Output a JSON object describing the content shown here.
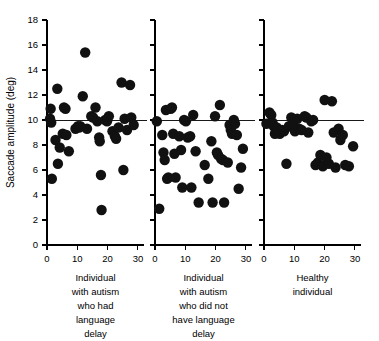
{
  "chart_data": {
    "type": "scatter",
    "title": "",
    "xlabel": "",
    "ylabel": "Saccade amplitude (deg)",
    "ylim": [
      0,
      18
    ],
    "xlim": [
      0,
      32
    ],
    "yticks": [
      0,
      2,
      4,
      6,
      8,
      10,
      12,
      14,
      16,
      18
    ],
    "ytick_labels": [
      "0",
      "2",
      "4",
      "6",
      "8",
      "10",
      "12",
      "14",
      "16",
      "18"
    ],
    "xticks": [
      0,
      10,
      20,
      30
    ],
    "xtick_labels": [
      "0",
      "10",
      "20",
      "30"
    ],
    "grid": false,
    "legend": "none",
    "reference_line": {
      "y": 10,
      "label": ""
    },
    "marker": {
      "shape": "circle",
      "color": "#111111",
      "size": 5.2
    },
    "panels": [
      {
        "id": "panel-autism-language-delay",
        "caption_lines": [
          "Individual",
          "with autism",
          "who had",
          "language",
          "delay"
        ],
        "caption": "Individual with autism who had language delay",
        "points": [
          {
            "x": 1.0,
            "y": 10.1
          },
          {
            "x": 1.2,
            "y": 10.9
          },
          {
            "x": 1.4,
            "y": 9.8
          },
          {
            "x": 1.6,
            "y": 5.3
          },
          {
            "x": 2.8,
            "y": 8.4
          },
          {
            "x": 3.4,
            "y": 12.5
          },
          {
            "x": 3.6,
            "y": 6.5
          },
          {
            "x": 4.2,
            "y": 7.8
          },
          {
            "x": 5.2,
            "y": 8.9
          },
          {
            "x": 5.6,
            "y": 11.0
          },
          {
            "x": 6.1,
            "y": 10.9
          },
          {
            "x": 6.4,
            "y": 8.8
          },
          {
            "x": 7.2,
            "y": 7.5
          },
          {
            "x": 9.4,
            "y": 9.3
          },
          {
            "x": 10.2,
            "y": 9.5
          },
          {
            "x": 10.6,
            "y": 9.4
          },
          {
            "x": 11.0,
            "y": 9.5
          },
          {
            "x": 11.8,
            "y": 11.9
          },
          {
            "x": 12.6,
            "y": 15.4
          },
          {
            "x": 13.2,
            "y": 9.3
          },
          {
            "x": 14.6,
            "y": 10.3
          },
          {
            "x": 15.2,
            "y": 10.2
          },
          {
            "x": 16.0,
            "y": 11.0
          },
          {
            "x": 16.6,
            "y": 9.9
          },
          {
            "x": 17.2,
            "y": 8.6
          },
          {
            "x": 17.4,
            "y": 8.3
          },
          {
            "x": 17.8,
            "y": 5.6
          },
          {
            "x": 18.0,
            "y": 2.8
          },
          {
            "x": 19.2,
            "y": 10.0
          },
          {
            "x": 19.8,
            "y": 9.9
          },
          {
            "x": 20.4,
            "y": 10.3
          },
          {
            "x": 21.6,
            "y": 9.1
          },
          {
            "x": 22.4,
            "y": 8.7
          },
          {
            "x": 22.8,
            "y": 8.5
          },
          {
            "x": 23.6,
            "y": 9.4
          },
          {
            "x": 24.6,
            "y": 13.0
          },
          {
            "x": 25.2,
            "y": 6.0
          },
          {
            "x": 25.6,
            "y": 10.1
          },
          {
            "x": 26.4,
            "y": 9.2
          },
          {
            "x": 27.4,
            "y": 12.8
          },
          {
            "x": 27.8,
            "y": 10.2
          },
          {
            "x": 28.6,
            "y": 9.6
          }
        ]
      },
      {
        "id": "panel-autism-no-language-delay",
        "caption_lines": [
          "Individual",
          "with autism",
          "who did not",
          "have language",
          "delay"
        ],
        "caption": "Individual with autism who did not have language delay",
        "points": [
          {
            "x": 0.6,
            "y": 9.9
          },
          {
            "x": 1.4,
            "y": 2.9
          },
          {
            "x": 2.4,
            "y": 8.8
          },
          {
            "x": 2.8,
            "y": 7.4
          },
          {
            "x": 3.2,
            "y": 6.8
          },
          {
            "x": 3.6,
            "y": 10.8
          },
          {
            "x": 4.0,
            "y": 5.3
          },
          {
            "x": 4.4,
            "y": 5.4
          },
          {
            "x": 5.2,
            "y": 10.9
          },
          {
            "x": 5.6,
            "y": 11.0
          },
          {
            "x": 6.0,
            "y": 8.9
          },
          {
            "x": 6.4,
            "y": 7.3
          },
          {
            "x": 6.8,
            "y": 5.4
          },
          {
            "x": 8.0,
            "y": 8.7
          },
          {
            "x": 8.6,
            "y": 7.6
          },
          {
            "x": 9.0,
            "y": 4.6
          },
          {
            "x": 9.6,
            "y": 10.0
          },
          {
            "x": 10.2,
            "y": 9.9
          },
          {
            "x": 10.8,
            "y": 8.6
          },
          {
            "x": 11.6,
            "y": 8.7
          },
          {
            "x": 12.0,
            "y": 4.6
          },
          {
            "x": 12.6,
            "y": 10.4
          },
          {
            "x": 13.4,
            "y": 7.5
          },
          {
            "x": 14.4,
            "y": 3.4
          },
          {
            "x": 16.4,
            "y": 6.4
          },
          {
            "x": 17.6,
            "y": 5.3
          },
          {
            "x": 18.6,
            "y": 8.3
          },
          {
            "x": 19.0,
            "y": 3.4
          },
          {
            "x": 19.8,
            "y": 10.3
          },
          {
            "x": 20.4,
            "y": 7.4
          },
          {
            "x": 20.8,
            "y": 7.2
          },
          {
            "x": 21.4,
            "y": 11.2
          },
          {
            "x": 21.8,
            "y": 6.9
          },
          {
            "x": 22.4,
            "y": 6.8
          },
          {
            "x": 22.8,
            "y": 3.4
          },
          {
            "x": 24.0,
            "y": 6.6
          },
          {
            "x": 24.6,
            "y": 9.6
          },
          {
            "x": 25.0,
            "y": 9.2
          },
          {
            "x": 25.4,
            "y": 8.9
          },
          {
            "x": 26.0,
            "y": 10.0
          },
          {
            "x": 26.4,
            "y": 9.7
          },
          {
            "x": 27.0,
            "y": 8.8
          },
          {
            "x": 27.6,
            "y": 4.5
          },
          {
            "x": 28.4,
            "y": 6.2
          },
          {
            "x": 29.0,
            "y": 7.7
          }
        ]
      },
      {
        "id": "panel-healthy-individual",
        "caption_lines": [
          "Healthy",
          "individual"
        ],
        "caption": "Healthy individual",
        "points": [
          {
            "x": 0.8,
            "y": 9.7
          },
          {
            "x": 1.8,
            "y": 10.6
          },
          {
            "x": 2.4,
            "y": 10.4
          },
          {
            "x": 2.8,
            "y": 9.8
          },
          {
            "x": 3.2,
            "y": 9.5
          },
          {
            "x": 3.6,
            "y": 8.9
          },
          {
            "x": 4.2,
            "y": 9.4
          },
          {
            "x": 4.6,
            "y": 9.2
          },
          {
            "x": 5.2,
            "y": 8.9
          },
          {
            "x": 6.0,
            "y": 9.2
          },
          {
            "x": 6.6,
            "y": 9.1
          },
          {
            "x": 7.4,
            "y": 6.5
          },
          {
            "x": 8.2,
            "y": 9.5
          },
          {
            "x": 9.0,
            "y": 10.2
          },
          {
            "x": 9.6,
            "y": 9.8
          },
          {
            "x": 10.2,
            "y": 9.1
          },
          {
            "x": 11.0,
            "y": 10.1
          },
          {
            "x": 11.6,
            "y": 9.3
          },
          {
            "x": 12.4,
            "y": 9.2
          },
          {
            "x": 13.4,
            "y": 10.3
          },
          {
            "x": 14.0,
            "y": 10.2
          },
          {
            "x": 14.6,
            "y": 9.0
          },
          {
            "x": 15.6,
            "y": 9.9
          },
          {
            "x": 16.2,
            "y": 10.0
          },
          {
            "x": 17.0,
            "y": 6.4
          },
          {
            "x": 17.8,
            "y": 6.6
          },
          {
            "x": 18.6,
            "y": 7.2
          },
          {
            "x": 19.4,
            "y": 6.3
          },
          {
            "x": 20.0,
            "y": 11.6
          },
          {
            "x": 20.6,
            "y": 7.0
          },
          {
            "x": 21.4,
            "y": 6.5
          },
          {
            "x": 22.4,
            "y": 11.5
          },
          {
            "x": 23.0,
            "y": 9.0
          },
          {
            "x": 23.6,
            "y": 6.2
          },
          {
            "x": 24.6,
            "y": 9.3
          },
          {
            "x": 25.2,
            "y": 8.4
          },
          {
            "x": 26.0,
            "y": 8.8
          },
          {
            "x": 26.8,
            "y": 6.4
          },
          {
            "x": 28.0,
            "y": 6.3
          },
          {
            "x": 29.4,
            "y": 7.9
          }
        ]
      }
    ]
  }
}
